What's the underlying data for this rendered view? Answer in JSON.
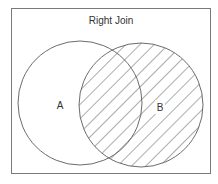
{
  "diagram": {
    "type": "venn",
    "title": "Right Join",
    "sets": [
      {
        "id": "A",
        "label": "A",
        "highlighted": false
      },
      {
        "id": "B",
        "label": "B",
        "highlighted": true
      }
    ],
    "highlight_pattern": "diagonal-hatch",
    "colors": {
      "frame": "#7a7a7a",
      "stroke": "#5a5a5a",
      "text": "#333333",
      "background": "#ffffff"
    }
  }
}
